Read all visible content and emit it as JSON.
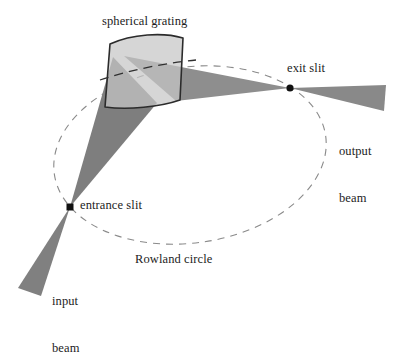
{
  "figure": {
    "background_color": "#ffffff"
  },
  "labels": {
    "spherical_grating": "spherical grating",
    "exit_slit": "exit slit",
    "output_beam_line1": "output",
    "output_beam_line2": "beam",
    "entrance_slit": "entrance slit",
    "rowland_circle": "Rowland circle",
    "input_beam_line1": "input",
    "input_beam_line2": "beam"
  },
  "colors": {
    "beam_fill": "#808080",
    "beam_fill_light": "#9a9a9a",
    "grating_face": "#c9c9c9",
    "grating_outline": "#2b2b2b",
    "circle_stroke": "#8a8a8a",
    "point_fill": "#111111",
    "text": "#1c1c1c"
  },
  "geometry": {
    "rowland_circle": {
      "shape": "ellipse-dashed",
      "center_x": 190,
      "center_y": 155,
      "radius_x": 137,
      "radius_y": 88,
      "rotation_deg": -8,
      "dash": "7 6"
    },
    "entrance_slit_point": {
      "x": 70,
      "y": 207
    },
    "exit_slit_point": {
      "x": 290,
      "y": 88
    },
    "grating": {
      "top_left": {
        "x": 110,
        "y": 44
      },
      "top_right": {
        "x": 183,
        "y": 38
      },
      "bottom_right": {
        "x": 180,
        "y": 100
      },
      "bottom_left": {
        "x": 105,
        "y": 107
      }
    },
    "input_beam": {
      "apex": {
        "x": 70,
        "y": 207
      },
      "far_left": {
        "x": 18,
        "y": 288
      },
      "far_right": {
        "x": 40,
        "y": 296
      }
    },
    "incident_beam": {
      "apex": {
        "x": 70,
        "y": 207
      },
      "grating_top": {
        "x": 113,
        "y": 58
      },
      "grating_bottom": {
        "x": 155,
        "y": 102
      }
    },
    "diffracted_beam": {
      "apex": {
        "x": 290,
        "y": 88
      },
      "grating_top": {
        "x": 126,
        "y": 57
      },
      "grating_bottom": {
        "x": 175,
        "y": 100
      }
    },
    "output_beam": {
      "apex": {
        "x": 290,
        "y": 88
      },
      "far_top": {
        "x": 386,
        "y": 86
      },
      "far_bottom": {
        "x": 384,
        "y": 110
      }
    }
  }
}
